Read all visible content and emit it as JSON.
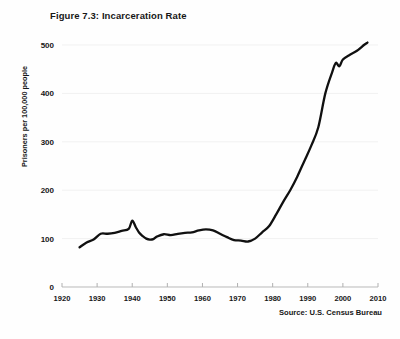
{
  "figure": {
    "title": "Figure 7.3: Incarceration Rate",
    "source": "Source: U.S. Census Bureau",
    "ylabel": "Prisoners per 100,000 people"
  },
  "chart_data": {
    "type": "line",
    "title": "Figure 7.3: Incarceration Rate",
    "xlabel": "",
    "ylabel": "Prisoners per 100,000 people",
    "annotation": "Source: U.S. Census Bureau",
    "grid": true,
    "legend": null,
    "xlim": [
      1920,
      2010
    ],
    "ylim": [
      0,
      500
    ],
    "xticks": [
      1920,
      1930,
      1940,
      1950,
      1960,
      1970,
      1980,
      1990,
      2000,
      2010
    ],
    "yticks": [
      0,
      100,
      200,
      300,
      400,
      500
    ],
    "series": [
      {
        "name": "Incarceration rate",
        "color": "#101010",
        "x": [
          1925,
          1927,
          1929,
          1931,
          1933,
          1935,
          1937,
          1939,
          1940,
          1941,
          1942,
          1943,
          1944,
          1945,
          1946,
          1947,
          1949,
          1951,
          1953,
          1955,
          1957,
          1959,
          1961,
          1963,
          1965,
          1967,
          1969,
          1971,
          1973,
          1975,
          1977,
          1979,
          1981,
          1983,
          1985,
          1987,
          1989,
          1991,
          1993,
          1995,
          1997,
          1998,
          1999,
          2000,
          2002,
          2004,
          2006,
          2007
        ],
        "y": [
          82,
          92,
          98,
          110,
          110,
          112,
          116,
          120,
          137,
          124,
          112,
          105,
          100,
          98,
          99,
          104,
          109,
          107,
          110,
          112,
          113,
          117,
          119,
          117,
          110,
          103,
          97,
          96,
          94,
          100,
          113,
          126,
          150,
          176,
          200,
          228,
          260,
          292,
          330,
          400,
          445,
          463,
          456,
          470,
          480,
          488,
          500,
          505
        ]
      }
    ]
  },
  "axes": {
    "ytick_labels": [
      "500",
      "400",
      "300",
      "200",
      "100",
      "0"
    ],
    "xtick_labels": [
      "1920",
      "1930",
      "1940",
      "1950",
      "1960",
      "1970",
      "1980",
      "1990",
      "2000",
      "2010"
    ]
  },
  "colors": {
    "line": "#101010",
    "grid": "#f1f1f1",
    "axis": "#b9b9b9",
    "text": "#171717",
    "background": "#fefefe"
  }
}
